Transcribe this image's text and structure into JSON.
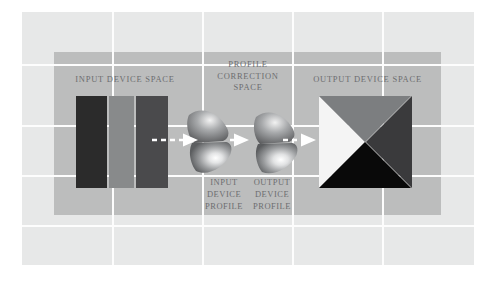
{
  "diagram": {
    "title_input_space": "INPUT DEVICE SPACE",
    "title_output_space": "OUTPUT DEVICE SPACE",
    "title_correction_space_line1": "PROFILE",
    "title_correction_space_line2": "CORRECTION",
    "title_correction_space_line3": "SPACE",
    "label_input_profile_line1": "INPUT",
    "label_input_profile_line2": "DEVICE",
    "label_input_profile_line3": "PROFILE",
    "label_output_profile_line1": "OUTPUT",
    "label_output_profile_line2": "DEVICE",
    "label_output_profile_line3": "PROFILE"
  },
  "colors": {
    "page_background": "#ffffff",
    "panel_background": "#e7e8e8",
    "band_background": "#bcbdbd",
    "grid_line": "#fdfdfd",
    "text": "#6d6e70",
    "arrow": "#ffffff",
    "input_bar_1": "#2b2b2b",
    "input_bar_2": "#888a8b",
    "input_bar_3": "#4a4a4c",
    "output_triangle_left": "#f4f4f4",
    "output_triangle_top": "#7c7e80",
    "output_triangle_right": "#3a3a3c",
    "output_triangle_bottom": "#090909",
    "cone_highlight": "#ffffff",
    "cone_shadow": "#5c5e60"
  },
  "grid": {
    "vertical_lines": [
      90,
      180,
      270,
      360
    ],
    "horizontal_lines": [
      52,
      113,
      163,
      213
    ]
  },
  "icons": {
    "arrow_1": "dashed-arrow-right-icon",
    "arrow_2": "dashed-arrow-right-icon",
    "arrow_3": "dashed-arrow-right-icon",
    "cone_input": "color-gamut-cone-icon",
    "cone_output": "color-gamut-cone-icon"
  }
}
